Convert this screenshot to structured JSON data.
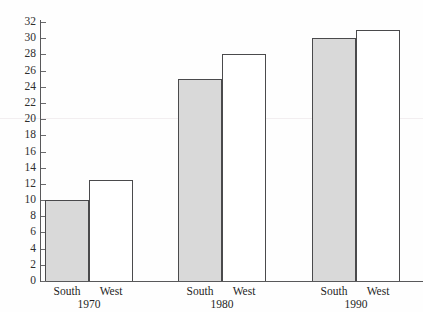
{
  "chart_data": {
    "type": "bar",
    "title": "",
    "xlabel": "",
    "ylabel": "",
    "ylim": [
      0,
      32
    ],
    "ytick_step": 2,
    "grid": false,
    "legend": "none",
    "categories": [
      "1970",
      "1980",
      "1990"
    ],
    "series": [
      {
        "name": "South",
        "values": [
          10,
          25,
          30
        ],
        "fill": "#d9d9d9"
      },
      {
        "name": "West",
        "values": [
          12.5,
          28,
          31
        ],
        "fill": "#ffffff"
      }
    ],
    "ytick_labels": [
      "0",
      "2",
      "4",
      "6",
      "8",
      "10",
      "12",
      "14",
      "16",
      "18",
      "20",
      "22",
      "24",
      "26",
      "28",
      "30",
      "32"
    ],
    "bar_outline_color": "#4a4a4c",
    "axis_color": "#58585a"
  },
  "axis": {
    "y_min": 0,
    "y_max": 32
  },
  "groups": [
    {
      "year": "1970",
      "bars": [
        {
          "label": "South",
          "value": 10,
          "style": "south"
        },
        {
          "label": "West",
          "value": 12.5,
          "style": "west"
        }
      ]
    },
    {
      "year": "1980",
      "bars": [
        {
          "label": "South",
          "value": 25,
          "style": "south"
        },
        {
          "label": "West",
          "value": 28,
          "style": "west"
        }
      ]
    },
    {
      "year": "1990",
      "bars": [
        {
          "label": "South",
          "value": 30,
          "style": "south"
        },
        {
          "label": "West",
          "value": 31,
          "style": "west"
        }
      ]
    }
  ]
}
